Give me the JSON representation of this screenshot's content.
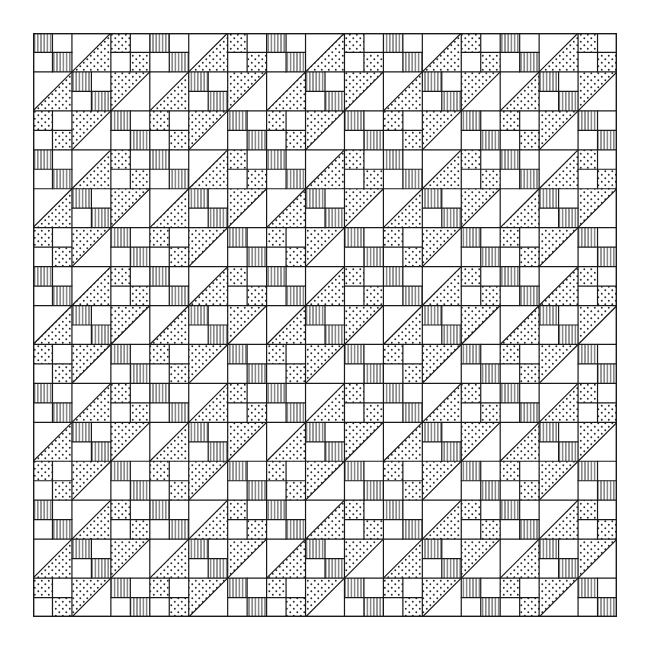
{
  "figure": {
    "type": "quilt-pattern-illustration",
    "grid": {
      "big_cells_per_side": 15,
      "sub_cells_per_big_cell": 2,
      "origin_px": [
        33,
        33
      ],
      "size_px": 584
    },
    "colors": {
      "background": "#ffffff",
      "line": "#1a1a1a",
      "hatch": "#2a2a2a",
      "dot": "#2a2a2a"
    },
    "block_types": {
      "H": "four-patch-hatched (top-left and bottom-right sub-squares vertically hatched)",
      "D": "four-patch-dotted (top-left and bottom-right sub-squares dotted)",
      "DLR": "half-square-triangle, diagonal bottom-left to top-right, lower-right triangle dotted",
      "DUL": "half-square-triangle, diagonal bottom-left to top-right, upper-left triangle dotted"
    },
    "repeat_tile": [
      [
        "H",
        "DLR",
        "D"
      ],
      [
        "DLR",
        "H",
        "DUL"
      ],
      [
        "D",
        "DUL",
        "H"
      ]
    ]
  }
}
